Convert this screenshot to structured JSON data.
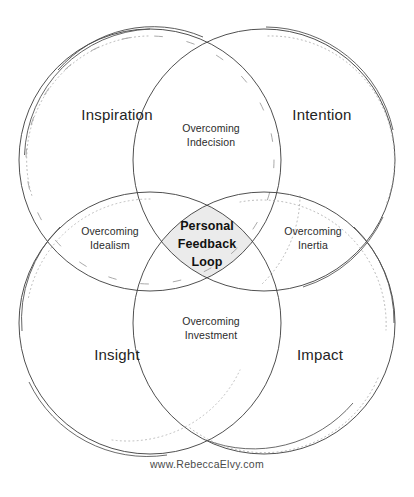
{
  "diagram": {
    "title": "Personal Feedback Loop",
    "center": {
      "text": "Personal\nFeedback\nLoop",
      "fill": "#ebebeb"
    },
    "quadrants": [
      {
        "id": "inspiration",
        "label": "Inspiration",
        "position": "top-left"
      },
      {
        "id": "intention",
        "label": "Intention",
        "position": "top-right"
      },
      {
        "id": "insight",
        "label": "Insight",
        "position": "bottom-left"
      },
      {
        "id": "impact",
        "label": "Impact",
        "position": "bottom-right"
      }
    ],
    "intersections": [
      {
        "id": "indecision",
        "label": "Overcoming\nIndecision",
        "between": "Inspiration + Intention"
      },
      {
        "id": "idealism",
        "label": "Overcoming\nIdealism",
        "between": "Inspiration + Insight"
      },
      {
        "id": "inertia",
        "label": "Overcoming\nInertia",
        "between": "Intention + Impact"
      },
      {
        "id": "investment",
        "label": "Overcoming\nInvestment",
        "between": "Insight + Impact"
      }
    ],
    "footer": {
      "text": "www.RebeccaElvy.com"
    },
    "colors": {
      "background": "#ffffff",
      "stroke": "#3c3c3c",
      "stroke_light": "#9a9a9a",
      "center_fill": "#ebebeb",
      "text": "#242424",
      "footer_text": "#4a4a4a"
    },
    "circles": [
      {
        "id": "inspiration-circle",
        "cx": 150,
        "cy": 160,
        "r": 131
      },
      {
        "id": "intention-circle",
        "cx": 264,
        "cy": 160,
        "r": 131
      },
      {
        "id": "insight-circle",
        "cx": 150,
        "cy": 323,
        "r": 131
      },
      {
        "id": "impact-circle",
        "cx": 264,
        "cy": 323,
        "r": 131
      }
    ]
  }
}
